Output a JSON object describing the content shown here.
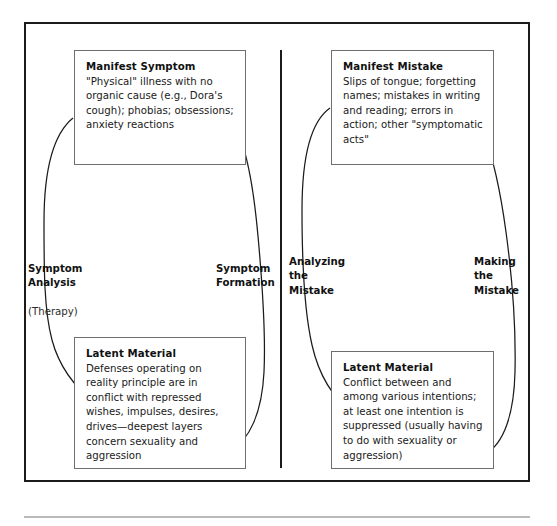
{
  "figure": {
    "panels": [
      {
        "id": "symptom-panel",
        "boxes": [
          {
            "id": "manifest-symptom",
            "title": "Manifest Symptom",
            "body": "\"Physical\" illness with no organic cause (e.g., Dora's cough); phobias; obsessions; anxiety reactions"
          },
          {
            "id": "latent-material-left",
            "title": "Latent Material",
            "body": "Defenses operating on reality principle are in conflict with repressed wishes, impulses, desires, drives—deepest layers concern sexuality and aggression"
          }
        ],
        "labels": [
          {
            "id": "symptom-analysis",
            "main": "Symptom\nAnalysis",
            "sub": "(Therapy)",
            "direction": "downward"
          },
          {
            "id": "symptom-formation",
            "main": "Symptom\nFormation",
            "sub": "",
            "direction": "upward"
          }
        ]
      },
      {
        "id": "mistake-panel",
        "boxes": [
          {
            "id": "manifest-mistake",
            "title": "Manifest Mistake",
            "body": "Slips of tongue; forgetting names; mistakes in writing and reading; errors in action; other \"symptomatic acts\""
          },
          {
            "id": "latent-material-right",
            "title": "Latent Material",
            "body": "Conflict between and among various intentions; at least one intention is suppressed (usually having to do with sexuality or aggression)"
          }
        ],
        "labels": [
          {
            "id": "analyzing-the-mistake",
            "main": "Analyzing\nthe\nMistake",
            "sub": "",
            "direction": "downward"
          },
          {
            "id": "making-the-mistake",
            "main": "Making\nthe\nMistake",
            "sub": "",
            "direction": "upward"
          }
        ]
      }
    ],
    "colors": {
      "frame": "#1b1b1b",
      "box_border": "#6f6f6f",
      "text": "#111111",
      "rule": "#b9b9b9",
      "background": "#ffffff"
    }
  }
}
